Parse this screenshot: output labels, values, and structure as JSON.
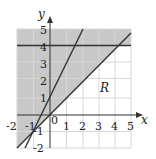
{
  "figure": {
    "x_axis_label": "x",
    "y_axis_label": "y",
    "region_label": "R",
    "x_ticks": [
      "-2",
      "-1",
      "0",
      "1",
      "2",
      "3",
      "4",
      "5"
    ],
    "y_ticks": [
      "-2",
      "-1",
      "1",
      "2",
      "3",
      "4",
      "5"
    ],
    "origin_label": "0",
    "x_range": [
      -2,
      5
    ],
    "y_range": [
      -2,
      5
    ],
    "lines": [
      {
        "name": "y = x",
        "points": [
          [
            -2,
            -2
          ],
          [
            5,
            5
          ]
        ]
      },
      {
        "name": "y = 2x + 1",
        "points": [
          [
            -1.5,
            -2
          ],
          [
            2,
            5
          ]
        ]
      },
      {
        "name": "y = 4",
        "points": [
          [
            -2,
            4
          ],
          [
            5,
            4
          ]
        ]
      }
    ],
    "shaded_description": "Region above y = x, plus band 4 ≤ y ≤ 5",
    "colors": {
      "shade": "#c8c8c8",
      "grid": "#d6d6d6",
      "line": "#333333"
    }
  }
}
